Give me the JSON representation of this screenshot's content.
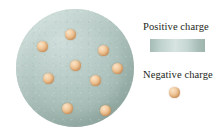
{
  "figure": {
    "background_color": "#ffffff"
  },
  "atom": {
    "name": "positive-charge-sphere",
    "description": "Uniform sphere of positive charge",
    "color_light": "#cfdedb",
    "color_mid": "#b2c6c1",
    "color_dark": "#8ba49c",
    "center": {
      "x": 75,
      "y": 68
    },
    "radius": 59,
    "electron_count": 9,
    "electrons": [
      {
        "name": "electron-1",
        "x": 70,
        "y": 34
      },
      {
        "name": "electron-2",
        "x": 42,
        "y": 46
      },
      {
        "name": "electron-3",
        "x": 103,
        "y": 50
      },
      {
        "name": "electron-4",
        "x": 75,
        "y": 65
      },
      {
        "name": "electron-5",
        "x": 117,
        "y": 68
      },
      {
        "name": "electron-6",
        "x": 48,
        "y": 78
      },
      {
        "name": "electron-7",
        "x": 95,
        "y": 80
      },
      {
        "name": "electron-8",
        "x": 67,
        "y": 108
      },
      {
        "name": "electron-9",
        "x": 105,
        "y": 110
      }
    ],
    "electron_color": "#e7b581",
    "electron_highlight": "#fae4c8",
    "electron_diameter": 11
  },
  "legend": {
    "positive": {
      "label": "Positive charge",
      "swatch_type": "gradient-bar",
      "swatch_colors": [
        "#a5bbb5",
        "#d7e4e1",
        "#9db4ad"
      ]
    },
    "negative": {
      "label": "Negative charge",
      "swatch_type": "sphere",
      "swatch_color": "#e7b581"
    }
  }
}
